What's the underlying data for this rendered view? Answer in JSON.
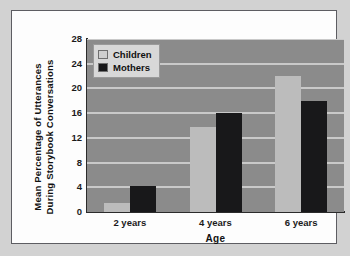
{
  "chart_data": {
    "type": "bar",
    "title": "",
    "xlabel": "Age",
    "ylabel_lines": [
      "Mean Percentage of Utterances",
      "During Storybook Conversations"
    ],
    "ylabel": "Mean Percentage of Utterances During Storybook Conversations",
    "categories": [
      "2 years",
      "4 years",
      "6 years"
    ],
    "series": [
      {
        "name": "Children",
        "values": [
          1.5,
          13.7,
          22.0
        ],
        "color": "#bcbcbc"
      },
      {
        "name": "Mothers",
        "values": [
          4.2,
          16.0,
          18.0
        ],
        "color": "#18181a"
      }
    ],
    "ylim": [
      0,
      28
    ],
    "yticks": [
      0,
      4,
      8,
      12,
      16,
      20,
      24,
      28
    ],
    "ytick_labels": [
      "0",
      "4",
      "8",
      "12",
      "16",
      "20",
      "24",
      "28"
    ],
    "grid": true,
    "grid_color": "#c9c9c9",
    "plot_background": "#8b8b8b",
    "figure_background": "#fdfdfd",
    "page_background": "#d2d2d2",
    "legend": {
      "position": "top-left",
      "entries": [
        {
          "label": "Children",
          "swatch": "#cfcfcf"
        },
        {
          "label": "Mothers",
          "swatch": "#18181a"
        }
      ]
    }
  }
}
